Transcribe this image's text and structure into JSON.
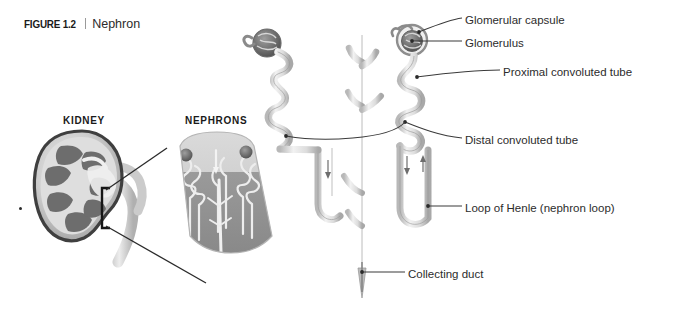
{
  "figure": {
    "number_label": "FIGURE 1.2",
    "separator": "|",
    "title": "Nephron"
  },
  "panels": {
    "kidney_heading": "KIDNEY",
    "nephrons_heading": "NEPHRONS"
  },
  "callouts": [
    {
      "id": "glomerular-capsule",
      "label": "Glomerular capsule",
      "x": 465,
      "y": 15
    },
    {
      "id": "glomerulus",
      "label": "Glomerulus",
      "x": 465,
      "y": 38
    },
    {
      "id": "proximal-convoluted-tube",
      "label": "Proximal convoluted tube",
      "x": 503,
      "y": 67
    },
    {
      "id": "distal-convoluted-tube",
      "label": "Distal convoluted tube",
      "x": 465,
      "y": 135
    },
    {
      "id": "loop-of-henle",
      "label": "Loop of Henle (nephron loop)",
      "x": 465,
      "y": 203
    },
    {
      "id": "collecting-duct",
      "label": "Collecting duct",
      "x": 408,
      "y": 269
    }
  ],
  "colors": {
    "background": "#ffffff",
    "text": "#2c2c2c",
    "heading": "#1a1a1a",
    "leader_line": "#3a3a3a",
    "tubule_outline": "#8c8c8c",
    "tubule_fill": "#e8e8e8",
    "tubule_shade": "#c6c6c6",
    "cortex": "#c9c9c9",
    "medulla": "#8f8f8f",
    "kidney_capsule": "#4a4a4a",
    "kidney_cortex": "#d6d6d6",
    "kidney_pyramid": "#707070",
    "glomerulus": "#6e6e6e"
  }
}
